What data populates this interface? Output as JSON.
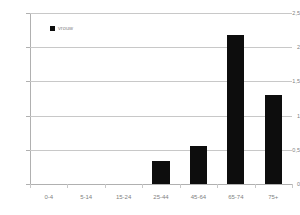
{
  "chart_data": {
    "type": "bar",
    "title": "",
    "subtitle": "",
    "xlabel": "",
    "ylabel": "",
    "categories": [
      "0-4",
      "5-14",
      "15-24",
      "25-44",
      "45-64",
      "65-74",
      "75+"
    ],
    "values": [
      0,
      0,
      0,
      0.34,
      0.55,
      2.18,
      1.3
    ],
    "series": [
      {
        "name": "vrouw",
        "values": [
          0,
          0,
          0,
          0.34,
          0.55,
          2.18,
          1.3
        ],
        "color": "#0d0d0d"
      }
    ],
    "ylim": [
      0,
      2.5
    ],
    "yticks": [
      0,
      0.5,
      1,
      1.5,
      2,
      2.5
    ],
    "ytick_labels": [
      "0",
      "0,5",
      "1",
      "1,5",
      "2",
      "2,5"
    ],
    "grid": true,
    "grid_axis": "y",
    "legend": {
      "position": "top-left-inside",
      "entries": [
        {
          "label": "vrouw",
          "color": "#0d0d0d",
          "marker": "square"
        }
      ]
    },
    "colors": {
      "bar": "#0d0d0d",
      "grid": "#c8c8c8",
      "axis": "#b0b0b0",
      "tick_text": "#7f7f7f",
      "background": "#ffffff"
    }
  }
}
